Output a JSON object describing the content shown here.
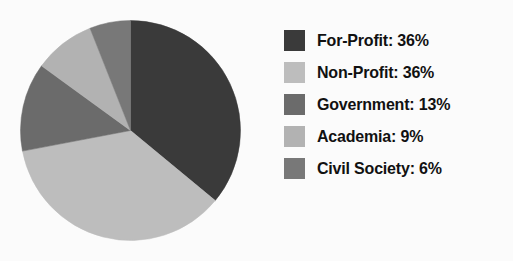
{
  "chart_data": {
    "type": "pie",
    "title": "",
    "subtitle": "",
    "xlabel": "",
    "ylabel": "",
    "grid": false,
    "legend_position": "right",
    "start_angle_deg": 0,
    "direction": "clockwise",
    "categories": [
      "For-Profit",
      "Non-Profit",
      "Government",
      "Academia",
      "Civil Society"
    ],
    "values": [
      36,
      36,
      13,
      9,
      6
    ],
    "value_unit": "%",
    "colors": [
      "#3a3a3a",
      "#bdbdbd",
      "#6b6b6b",
      "#b2b2b2",
      "#787878"
    ],
    "slices": [
      {
        "label": "For-Profit",
        "value": 36,
        "display": "36%",
        "color": "#3a3a3a",
        "legend_text": "For-Profit: 36%"
      },
      {
        "label": "Non-Profit",
        "value": 36,
        "display": "36%",
        "color": "#bdbdbd",
        "legend_text": "Non-Profit: 36%"
      },
      {
        "label": "Government",
        "value": 13,
        "display": "13%",
        "color": "#6b6b6b",
        "legend_text": "Government: 13%"
      },
      {
        "label": "Academia",
        "value": 9,
        "display": "9%",
        "color": "#b2b2b2",
        "legend_text": "Academia: 9%"
      },
      {
        "label": "Civil Society",
        "value": 6,
        "display": "6%",
        "color": "#787878",
        "legend_text": "Civil Society: 6%"
      }
    ]
  },
  "legend": {
    "items": [
      {
        "label": "For-Profit: 36%",
        "color": "#3a3a3a"
      },
      {
        "label": "Non-Profit: 36%",
        "color": "#bdbdbd"
      },
      {
        "label": "Government: 13%",
        "color": "#6b6b6b"
      },
      {
        "label": "Academia: 9%",
        "color": "#b2b2b2"
      },
      {
        "label": "Civil Society: 6%",
        "color": "#787878"
      }
    ]
  },
  "colors": {
    "background": "#fbfbfb",
    "text": "#111111"
  }
}
